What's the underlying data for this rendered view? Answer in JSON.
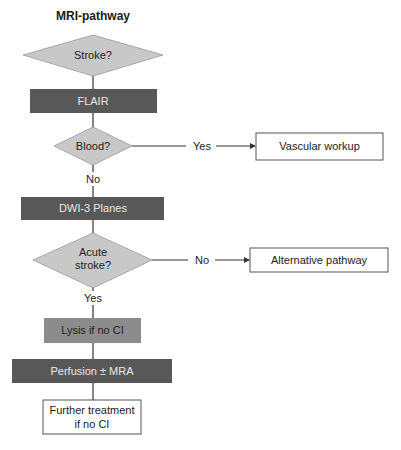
{
  "title": "MRI-pathway",
  "colors": {
    "diamond_fill": "#c8c8c8",
    "dark_box": "#585858",
    "medium_box": "#8c8c8c",
    "line": "#333333",
    "outline_box_border": "#555555"
  },
  "nodes": {
    "stroke": {
      "label": "Stroke?",
      "shape": "diamond"
    },
    "flair": {
      "label": "FLAIR",
      "shape": "dark-box"
    },
    "blood": {
      "label": "Blood?",
      "shape": "diamond"
    },
    "vascular": {
      "label": "Vascular workup",
      "shape": "outline-box"
    },
    "dwi": {
      "label": "DWI-3 Planes",
      "shape": "dark-box"
    },
    "acute": {
      "line1": "Acute",
      "line2": "stroke?",
      "shape": "diamond"
    },
    "alternative": {
      "label": "Alternative pathway",
      "shape": "outline-box"
    },
    "lysis": {
      "label": "Lysis if no CI",
      "shape": "medium-box"
    },
    "perfusion": {
      "label": "Perfusion ± MRA",
      "shape": "dark-box"
    },
    "further": {
      "line1": "Further treatment",
      "line2": "if no CI",
      "shape": "outline-box"
    }
  },
  "edges": {
    "blood_yes": "Yes",
    "blood_no": "No",
    "acute_no": "No",
    "acute_yes": "Yes"
  }
}
